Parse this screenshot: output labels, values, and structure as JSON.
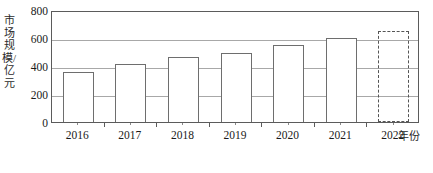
{
  "chart_data": {
    "type": "bar",
    "title": "",
    "xlabel": "年份",
    "ylabel": "市场规模/亿元",
    "categories": [
      "2016",
      "2017",
      "2018",
      "2019",
      "2020",
      "2021",
      "2022"
    ],
    "values": [
      355,
      415,
      465,
      490,
      550,
      600,
      650
    ],
    "series": [
      {
        "name": "市场规模",
        "values": [
          355,
          415,
          465,
          490,
          550,
          600,
          650
        ]
      }
    ],
    "ylim": [
      0,
      800
    ],
    "y_ticks": [
      "0",
      "200",
      "400",
      "600",
      "800"
    ],
    "y_tick_values": [
      0,
      200,
      400,
      600,
      800
    ],
    "grid": true,
    "grid_axis": "y",
    "legend": false,
    "legend_position": "none",
    "bar_styles": [
      "solid",
      "solid",
      "solid",
      "solid",
      "solid",
      "solid",
      "dashed"
    ],
    "annotations": [
      {
        "category": "2022",
        "note": "dashed outline bar (projected value)"
      }
    ],
    "colors": {
      "bar_fill": "#ffffff",
      "bar_stroke": "#6e6e6e",
      "dashed_bar_stroke": "#555555",
      "axis": "#5b5b5b",
      "gridline": "#a8a8a8",
      "text": "#1a1a1a"
    }
  },
  "axis": {
    "y_title": "市场规模/亿元",
    "x_title": "年份"
  }
}
